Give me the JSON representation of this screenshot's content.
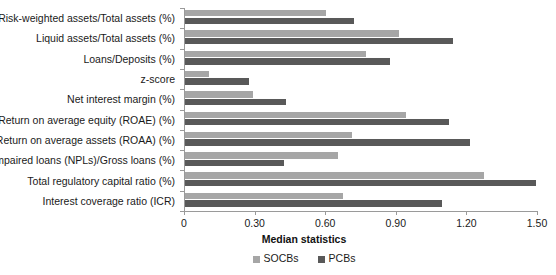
{
  "chart_data": {
    "type": "bar",
    "orientation": "horizontal",
    "title": "",
    "xlabel": "Median statistics",
    "ylabel": "",
    "xlim": [
      0,
      1.5
    ],
    "xticks": [
      "0",
      "0.30",
      "0.60",
      "0.90",
      "1.20",
      "1.50"
    ],
    "xtick_values": [
      0,
      0.3,
      0.6,
      0.9,
      1.2,
      1.5
    ],
    "grid": false,
    "legend_position": "bottom",
    "categories": [
      "Risk-weighted assets/Total assets (%)",
      "Liquid assets/Total assets (%)",
      "Loans/Deposits (%)",
      "z-score",
      "Net interest margin (%)",
      "Return on average equity (ROAE) (%)",
      "Return on average assets (ROAA) (%)",
      "Impaired loans (NPLs)/Gross loans (%)",
      "Total regulatory capital ratio (%)",
      "Interest coverage ratio (ICR)"
    ],
    "series": [
      {
        "name": "SOCBs",
        "color": "#a6a6a6",
        "values": [
          0.6,
          0.91,
          0.77,
          0.1,
          0.29,
          0.94,
          0.71,
          0.65,
          1.27,
          0.67
        ]
      },
      {
        "name": "PCBs",
        "color": "#595959",
        "values": [
          0.72,
          1.14,
          0.87,
          0.27,
          0.43,
          1.12,
          1.21,
          0.42,
          1.49,
          1.09
        ]
      }
    ]
  },
  "colors": {
    "socb": "#a6a6a6",
    "pcb": "#595959",
    "axis": "#9a9a9a",
    "text": "#1a1a1a",
    "background": "#ffffff"
  }
}
